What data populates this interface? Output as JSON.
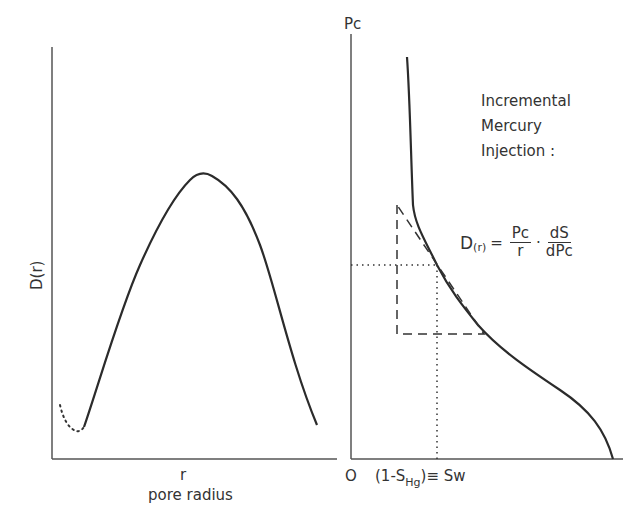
{
  "left_panel": {
    "y_label": "D(r)",
    "x_label": "r",
    "x_caption": "pore radius"
  },
  "right_panel": {
    "y_label": "Pc",
    "origin_label": "O",
    "x_label_prefix": "(1-S",
    "x_label_sub": "Hg",
    "x_label_suffix": ")≡ Sw",
    "annotation_line1": "Incremental",
    "annotation_line2": "Mercury",
    "annotation_line3": "Injection :",
    "formula": {
      "lhs": "D",
      "lhs_sub": "(r)",
      "equals": "=",
      "frac1_num": "Pc",
      "frac1_den": "r",
      "dot": "·",
      "frac2_num": "dS",
      "frac2_den": "dPc"
    }
  },
  "colors": {
    "line": "#2b2b2b",
    "axis": "#555555",
    "background": "#ffffff"
  }
}
